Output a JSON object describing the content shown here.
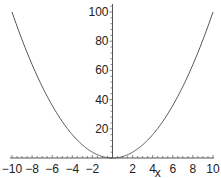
{
  "chart_data": {
    "type": "line",
    "title": "",
    "xlabel": "x",
    "ylabel": "",
    "xlim": [
      -10,
      10
    ],
    "ylim": [
      0,
      100
    ],
    "grid": false,
    "legend": null,
    "x_ticks": [
      -10,
      -8,
      -6,
      -4,
      -2,
      2,
      4,
      6,
      8,
      10
    ],
    "x_tick_labels": [
      "−10",
      "−8",
      "−6",
      "−4",
      "−2",
      "2",
      "4",
      "6",
      "8",
      "10"
    ],
    "y_ticks": [
      20,
      40,
      60,
      80,
      100
    ],
    "y_tick_labels": [
      "20",
      "40",
      "60",
      "80",
      "100"
    ],
    "series": [
      {
        "name": "x^2",
        "function": "x^2",
        "x": [
          -10,
          -9,
          -8,
          -7,
          -6,
          -5,
          -4,
          -3,
          -2,
          -1,
          0,
          1,
          2,
          3,
          4,
          5,
          6,
          7,
          8,
          9,
          10
        ],
        "values": [
          100,
          81,
          64,
          49,
          36,
          25,
          16,
          9,
          4,
          1,
          0,
          1,
          4,
          9,
          16,
          25,
          36,
          49,
          64,
          81,
          100
        ],
        "color": "#555555"
      }
    ]
  },
  "colors": {
    "axis": "#555555",
    "curve": "#555555",
    "text": "#222222"
  }
}
